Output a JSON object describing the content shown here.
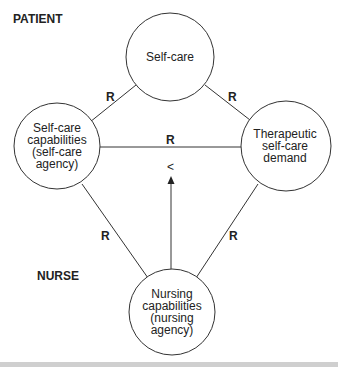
{
  "diagram": {
    "section_labels": {
      "patient": "PATIENT",
      "nurse": "NURSE"
    },
    "nodes": {
      "self_care": {
        "lines": [
          "Self-care"
        ]
      },
      "self_care_capabilities": {
        "lines": [
          "Self-care",
          "capabilities",
          "(self-care",
          "agency)"
        ]
      },
      "therapeutic_demand": {
        "lines": [
          "Therapeutic",
          "self-care",
          "demand"
        ]
      },
      "nursing_capabilities": {
        "lines": [
          "Nursing",
          "capabilities",
          "(nursing",
          "agency)"
        ]
      }
    },
    "relation_labels": {
      "top_left": "R",
      "top_right": "R",
      "middle": "R",
      "bottom_left": "R",
      "bottom_right": "R",
      "arrow_symbol": "<"
    }
  }
}
